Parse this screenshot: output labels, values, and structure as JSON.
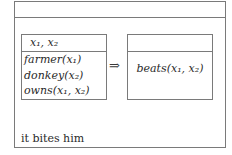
{
  "diagram": {
    "type": "Discourse Representation Structure",
    "outer_box": {
      "referents": "",
      "antecedent": {
        "referents": "x₁, x₂",
        "conditions": [
          "farmer(x₁)",
          "donkey(x₂)",
          "owns(x₁, x₂)"
        ]
      },
      "implication_symbol": "⇒",
      "consequent": {
        "referents": "",
        "conditions": [
          "beats(x₁, x₂)"
        ]
      }
    },
    "sentence": "it bites him"
  },
  "colors": {
    "border": "#7a7a7a",
    "text": "#2a2a2a",
    "background": "#ffffff"
  }
}
